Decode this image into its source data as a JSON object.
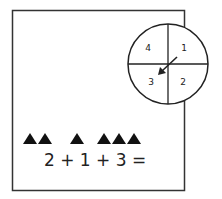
{
  "spinner": {
    "sections": [
      {
        "label": "4",
        "position": "top-left"
      },
      {
        "label": "1",
        "position": "top-right"
      },
      {
        "label": "3",
        "position": "bottom-left"
      },
      {
        "label": "2",
        "position": "bottom-right"
      }
    ],
    "arrow_points_to": "3"
  },
  "triangles": {
    "groups": [
      2,
      1,
      3
    ],
    "color": "#111111"
  },
  "equation": {
    "text": "2 + 1 + 3 ="
  }
}
